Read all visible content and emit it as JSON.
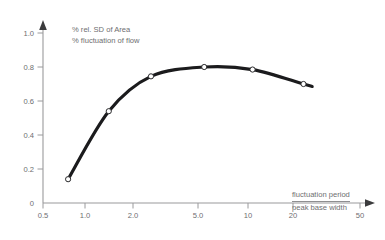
{
  "chart_data": {
    "type": "line",
    "title": "",
    "subtitle": "",
    "ylabel_line1": "% rel. SD of Area",
    "ylabel_line2": "% fluctuation of flow",
    "xlabel_numerator": "fluctuation period",
    "xlabel_denominator": "peak base width",
    "xscale": "log",
    "xlim": [
      0.5,
      50
    ],
    "ylim": [
      0,
      1.0
    ],
    "grid": false,
    "legend": "none",
    "x_ticks": [
      {
        "value": 0.5,
        "label": "0.5"
      },
      {
        "value": 1.0,
        "label": "1.0"
      },
      {
        "value": 2.0,
        "label": "2.0"
      },
      {
        "value": 5.0,
        "label": "5.0"
      },
      {
        "value": 10,
        "label": "10"
      },
      {
        "value": 20,
        "label": "20"
      },
      {
        "value": 50,
        "label": "50"
      }
    ],
    "y_ticks": [
      {
        "value": 0,
        "label": "0"
      },
      {
        "value": 0.2,
        "label": "0.2"
      },
      {
        "value": 0.4,
        "label": "0.4"
      },
      {
        "value": 0.6,
        "label": "0.6"
      },
      {
        "value": 0.8,
        "label": "0.8"
      },
      {
        "value": 1.0,
        "label": "1.0"
      }
    ],
    "series": [
      {
        "name": "relative SD of area",
        "marker": "open-circle",
        "color": "#1b1b1d",
        "x": [
          0.72,
          1.3,
          2.4,
          5.2,
          10.5,
          22.0
        ],
        "values": [
          0.14,
          0.54,
          0.745,
          0.8,
          0.785,
          0.7
        ]
      }
    ],
    "curve_extends_beyond_last_point": true,
    "axis_color": "#9a9a9c",
    "text_color": "#6e6e70",
    "curve_color": "#1b1b1d",
    "background_color": "#ffffff"
  }
}
